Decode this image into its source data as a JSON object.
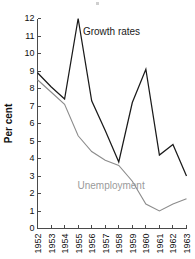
{
  "chart_data": {
    "type": "line",
    "title": "",
    "xlabel": "",
    "ylabel": "Per cent",
    "ylim": [
      0,
      12
    ],
    "ytick_step": 1,
    "grid": false,
    "legend_position": "inline-annotation",
    "categories": [
      "1952",
      "1953",
      "1954",
      "1955",
      "1956",
      "1957",
      "1958",
      "1959",
      "1960",
      "1961",
      "1962",
      "1963"
    ],
    "series": [
      {
        "name": "Growth rates",
        "color": "#1a1a1a",
        "values": [
          8.9,
          8.1,
          7.4,
          12.0,
          7.3,
          5.6,
          3.8,
          7.2,
          9.1,
          4.2,
          4.8,
          3.0
        ]
      },
      {
        "name": "Unemployment",
        "color": "#8c8c8c",
        "values": [
          8.5,
          7.8,
          7.1,
          5.3,
          4.4,
          3.9,
          3.6,
          2.7,
          1.4,
          1.0,
          1.4,
          1.7
        ]
      }
    ],
    "annotations": [
      {
        "text": "Growth rates",
        "color": "#1a1a1a",
        "x": 1955.35,
        "y": 11.05
      },
      {
        "text": "Unemployment",
        "color": "#9a9a9a",
        "x": 1954.95,
        "y": 2.28
      }
    ],
    "ytick_labels": [
      "0",
      "1",
      "2",
      "3",
      "4",
      "5",
      "6",
      "7",
      "8",
      "9",
      "10",
      "11",
      "12"
    ]
  }
}
